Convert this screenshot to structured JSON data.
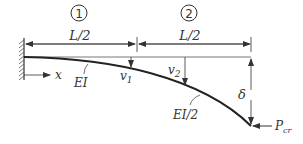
{
  "diagram": {
    "type": "cantilever column buckling (stepped stiffness)",
    "segments": [
      {
        "id": "1",
        "length_label": "L/2",
        "stiffness_label": "EI",
        "deflection_label": "v1"
      },
      {
        "id": "2",
        "length_label": "L/2",
        "stiffness_label": "EI/2",
        "deflection_label": "v2"
      }
    ],
    "axis_label": "x",
    "tip_deflection_label": "δ",
    "load_label": "P",
    "load_subscript": "cr",
    "colors": {
      "line": "#333333",
      "curve": "#222222",
      "background": "#ffffff"
    }
  }
}
